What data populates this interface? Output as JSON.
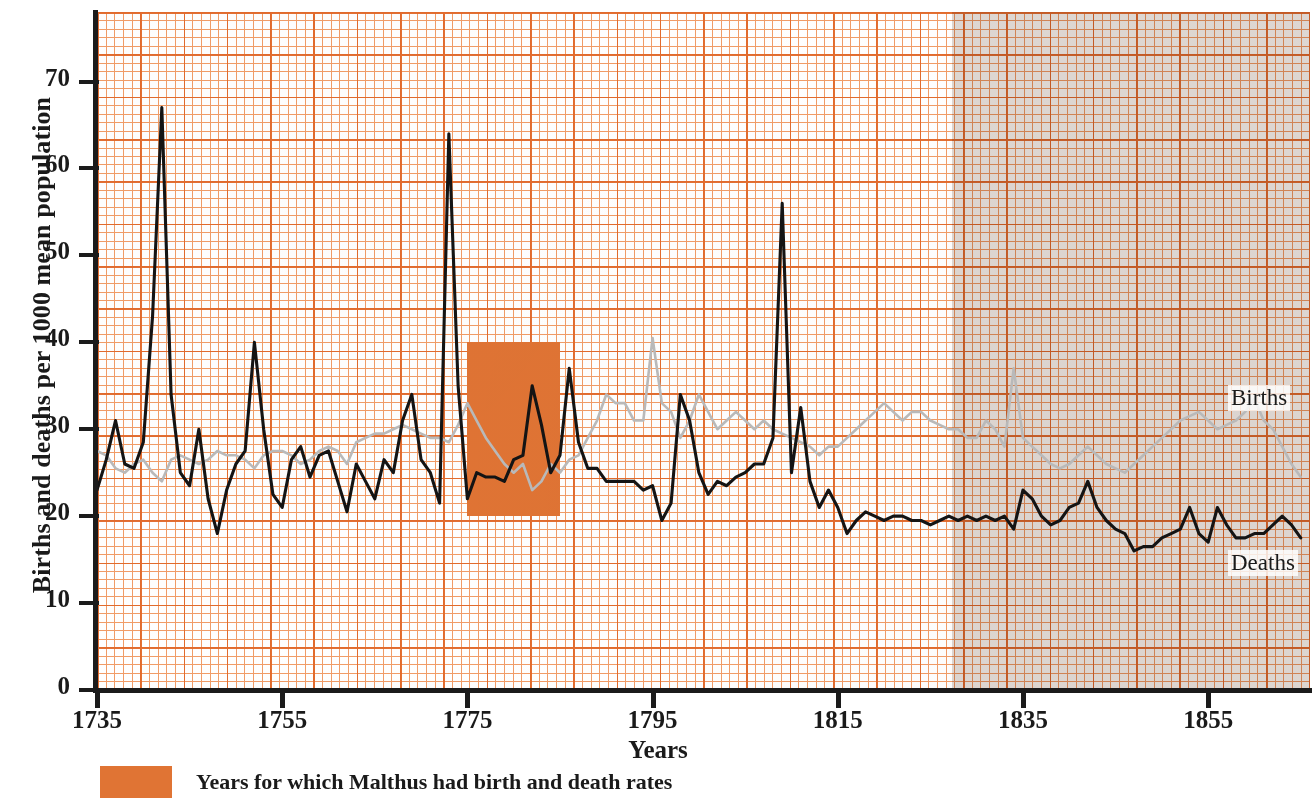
{
  "chart_data": {
    "type": "line",
    "title": "",
    "xlabel": "Years",
    "ylabel": "Births and deaths per 1000 mean population",
    "xlim": [
      1735,
      1866
    ],
    "ylim": [
      0,
      78
    ],
    "xticks": [
      1735,
      1755,
      1775,
      1795,
      1815,
      1835,
      1855
    ],
    "xtick_labels": [
      "1735",
      "1755",
      "1775",
      "1795",
      "1815",
      "1835",
      "1855"
    ],
    "yticks": [
      0,
      10,
      20,
      30,
      40,
      50,
      60,
      70
    ],
    "ytick_labels": [
      "0",
      "10",
      "20",
      "30",
      "40",
      "50",
      "60",
      "70"
    ],
    "grid": "graph-paper orange, minor every 1 year / 1 unit, major every 5 years / 5 units",
    "legend_position": "inline-right-labels",
    "annotations": [
      {
        "name": "births-series-label",
        "text": "Births",
        "x": 1866,
        "y": 34
      },
      {
        "name": "deaths-series-label",
        "text": "Deaths",
        "x": 1866,
        "y": 15
      }
    ],
    "highlight_band": {
      "label": "Years for which Malthus had birth and death rates",
      "color": "#e07434",
      "x_start": 1775,
      "x_end": 1785,
      "y_bottom": 20,
      "y_top": 40
    },
    "colors": {
      "births": "#b9b9b9",
      "deaths": "#141414",
      "grid_minor": "#ef8b4d",
      "grid_major": "#e2692a",
      "highlight": "#e07434",
      "axis": "#1b1b1b"
    },
    "series": [
      {
        "name": "Deaths",
        "color": "#141414",
        "x": [
          1735,
          1736,
          1737,
          1738,
          1739,
          1740,
          1741,
          1742,
          1743,
          1744,
          1745,
          1746,
          1747,
          1748,
          1749,
          1750,
          1751,
          1752,
          1753,
          1754,
          1755,
          1756,
          1757,
          1758,
          1759,
          1760,
          1761,
          1762,
          1763,
          1764,
          1765,
          1766,
          1767,
          1768,
          1769,
          1770,
          1771,
          1772,
          1773,
          1774,
          1775,
          1776,
          1777,
          1778,
          1779,
          1780,
          1781,
          1782,
          1783,
          1784,
          1785,
          1786,
          1787,
          1788,
          1789,
          1790,
          1791,
          1792,
          1793,
          1794,
          1795,
          1796,
          1797,
          1798,
          1799,
          1800,
          1801,
          1802,
          1803,
          1804,
          1805,
          1806,
          1807,
          1808,
          1809,
          1810,
          1811,
          1812,
          1813,
          1814,
          1815,
          1816,
          1817,
          1818,
          1819,
          1820,
          1821,
          1822,
          1823,
          1824,
          1825,
          1826,
          1827,
          1828,
          1829,
          1830,
          1831,
          1832,
          1833,
          1834,
          1835,
          1836,
          1837,
          1838,
          1839,
          1840,
          1841,
          1842,
          1843,
          1844,
          1845,
          1846,
          1847,
          1848,
          1849,
          1850,
          1851,
          1852,
          1853,
          1854,
          1855,
          1856,
          1857,
          1858,
          1859,
          1860,
          1861,
          1862,
          1863,
          1864,
          1865
        ],
        "values": [
          23,
          26.5,
          31,
          26,
          25.5,
          28.5,
          43,
          67,
          34,
          25,
          23.5,
          30,
          22,
          18,
          23,
          26,
          27.5,
          40,
          30,
          22.5,
          21,
          26.5,
          28,
          24.5,
          27,
          27.5,
          24,
          20.5,
          26,
          24,
          22,
          26.5,
          25,
          31,
          34,
          26.5,
          25,
          21.5,
          64,
          35,
          22,
          25,
          24.5,
          24.5,
          24,
          26.5,
          27,
          35,
          30.5,
          25,
          27,
          37,
          28.5,
          25.5,
          25.5,
          24,
          24,
          24,
          24,
          23,
          23.5,
          19.5,
          21.5,
          34,
          31,
          25,
          22.5,
          24,
          23.5,
          24.5,
          25,
          26,
          26,
          29,
          56,
          25,
          32.5,
          24,
          21,
          23,
          21,
          18,
          19.5,
          20.5,
          20,
          19.5,
          20,
          20,
          19.5,
          19.5,
          19,
          19.5,
          20,
          19.5,
          20,
          19.5,
          20,
          19.5,
          20,
          18.5,
          23,
          22,
          20,
          19,
          19.5,
          21,
          21.5,
          24,
          21,
          19.5,
          18.5,
          18,
          16,
          16.5,
          16.5,
          17.5,
          18,
          18.5,
          21,
          18,
          17,
          21,
          19,
          17.5,
          17.5,
          18,
          18,
          19,
          20,
          19,
          17.5
        ]
      },
      {
        "name": "Births",
        "color": "#b9b9b9",
        "x": [
          1735,
          1736,
          1737,
          1738,
          1739,
          1740,
          1741,
          1742,
          1743,
          1744,
          1745,
          1746,
          1747,
          1748,
          1749,
          1750,
          1751,
          1752,
          1753,
          1754,
          1755,
          1756,
          1757,
          1758,
          1759,
          1760,
          1761,
          1762,
          1763,
          1764,
          1765,
          1766,
          1767,
          1768,
          1769,
          1770,
          1771,
          1772,
          1773,
          1774,
          1775,
          1776,
          1777,
          1778,
          1779,
          1780,
          1781,
          1782,
          1783,
          1784,
          1785,
          1786,
          1787,
          1788,
          1789,
          1790,
          1791,
          1792,
          1793,
          1794,
          1795,
          1796,
          1797,
          1798,
          1799,
          1800,
          1801,
          1802,
          1803,
          1804,
          1805,
          1806,
          1807,
          1808,
          1809,
          1810,
          1811,
          1812,
          1813,
          1814,
          1815,
          1816,
          1817,
          1818,
          1819,
          1820,
          1821,
          1822,
          1823,
          1824,
          1825,
          1826,
          1827,
          1828,
          1829,
          1830,
          1831,
          1832,
          1833,
          1834,
          1835,
          1836,
          1837,
          1838,
          1839,
          1840,
          1841,
          1842,
          1843,
          1844,
          1845,
          1846,
          1847,
          1848,
          1849,
          1850,
          1851,
          1852,
          1853,
          1854,
          1855,
          1856,
          1857,
          1858,
          1859,
          1860,
          1861,
          1862,
          1863,
          1864,
          1865
        ],
        "values": [
          27.5,
          27,
          25.5,
          25,
          26,
          26.5,
          25,
          24,
          26.5,
          27,
          26.5,
          26,
          26.5,
          27.5,
          27,
          27,
          26.5,
          25.5,
          27,
          27.5,
          27.5,
          27,
          26,
          26.5,
          27.5,
          28,
          27.5,
          26,
          28.5,
          29,
          29.5,
          29.5,
          30,
          30.5,
          30,
          29.5,
          29,
          29,
          28.5,
          30.5,
          33,
          31,
          29,
          27.5,
          26,
          25,
          26,
          23,
          24,
          26,
          25,
          26.5,
          27,
          29,
          31,
          34,
          33,
          33,
          31,
          31,
          40.5,
          33,
          32,
          29,
          31,
          34,
          32,
          30,
          31,
          32,
          31,
          30,
          31,
          30,
          29.5,
          29,
          28.5,
          28,
          27,
          28,
          28,
          29,
          30,
          31,
          32,
          33,
          32,
          31,
          32,
          32,
          31,
          30.5,
          30,
          30,
          29,
          29,
          31,
          30,
          28,
          37,
          29,
          28,
          27,
          26,
          25.5,
          26,
          27,
          28,
          27,
          26,
          25.5,
          25,
          26,
          27,
          28,
          29,
          30,
          31,
          31.5,
          32,
          31,
          30,
          30.5,
          31,
          32,
          33.5,
          31,
          30,
          28,
          26,
          24.5
        ]
      }
    ]
  },
  "axis": {
    "y_title": "Births and deaths per 1000 mean population",
    "x_title": "Years"
  },
  "legend": {
    "swatch_color": "#e07434",
    "text": "Years for which Malthus had birth and death rates"
  },
  "series_tags": {
    "births": "Births",
    "deaths": "Deaths"
  }
}
